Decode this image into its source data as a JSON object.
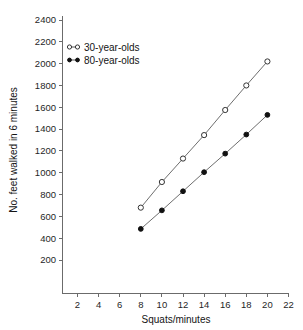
{
  "chart_data": {
    "type": "line",
    "title": "",
    "xlabel": "Squats/minutes",
    "ylabel": "No. feet walked in 6 minutes",
    "x": [
      8,
      10,
      12,
      14,
      16,
      18,
      20
    ],
    "xlim": [
      0,
      23
    ],
    "ylim": [
      0,
      2500
    ],
    "xticks": [
      2,
      4,
      6,
      8,
      10,
      12,
      14,
      16,
      18,
      20,
      22
    ],
    "yticks": [
      200,
      400,
      600,
      800,
      1000,
      1200,
      1400,
      1600,
      1800,
      2000,
      2200,
      2400
    ],
    "grid": false,
    "legend_position": "upper-left-inside",
    "series": [
      {
        "name": "30-year-olds",
        "marker": "open-circle",
        "color": "#333333",
        "values": [
          680,
          915,
          1130,
          1345,
          1575,
          1800,
          2020
        ]
      },
      {
        "name": "80-year-olds",
        "marker": "filled-circle",
        "color": "#111111",
        "values": [
          485,
          655,
          830,
          1005,
          1175,
          1350,
          1530
        ]
      }
    ]
  },
  "legend": {
    "entries": [
      {
        "label": "30-year-olds"
      },
      {
        "label": "80-year-olds"
      }
    ]
  }
}
